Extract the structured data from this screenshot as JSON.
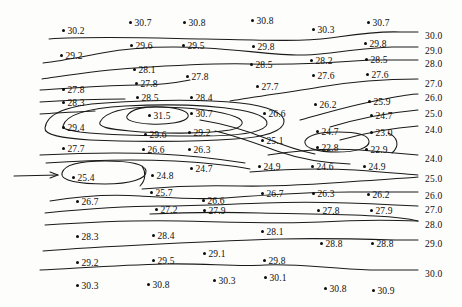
{
  "figure": {
    "type": "contour-map",
    "background_color": "#fdfdfc",
    "line_color": "#1a1a1a",
    "text_color": "#0d0d0d"
  },
  "annotations": {
    "flow_arrow": {
      "name": "left-flow-arrow",
      "x1": 14,
      "y1": 176,
      "x2": 62,
      "y2": 175
    }
  },
  "chart_data": {
    "type": "heatmap",
    "title": "",
    "xlabel": "",
    "ylabel": "",
    "contour_interval": 1.0,
    "contour_levels": [
      24.0,
      25.0,
      26.0,
      27.0,
      28.0,
      29.0,
      30.0
    ],
    "grid": false,
    "legend": "none",
    "right_axis_labels": [
      {
        "text": "30.0",
        "x": 425,
        "y": 32
      },
      {
        "text": "29.0",
        "x": 425,
        "y": 47
      },
      {
        "text": "28.0",
        "x": 425,
        "y": 60
      },
      {
        "text": "27.0",
        "x": 425,
        "y": 80
      },
      {
        "text": "26.0",
        "x": 425,
        "y": 94
      },
      {
        "text": "25.0",
        "x": 425,
        "y": 110
      },
      {
        "text": "24.0",
        "x": 425,
        "y": 126
      },
      {
        "text": "24.0",
        "x": 425,
        "y": 155
      },
      {
        "text": "25.0",
        "x": 425,
        "y": 175
      },
      {
        "text": "26.0",
        "x": 425,
        "y": 192
      },
      {
        "text": "27.0",
        "x": 425,
        "y": 206
      },
      {
        "text": "28.0",
        "x": 425,
        "y": 221
      },
      {
        "text": "29.0",
        "x": 425,
        "y": 240
      },
      {
        "text": "30.0",
        "x": 425,
        "y": 270
      }
    ],
    "points": [
      {
        "value": "30.2",
        "x": 62,
        "y": 27
      },
      {
        "value": "30.7",
        "x": 129,
        "y": 19
      },
      {
        "value": "30.8",
        "x": 183,
        "y": 19
      },
      {
        "value": "30.8",
        "x": 251,
        "y": 17
      },
      {
        "value": "30.3",
        "x": 312,
        "y": 26
      },
      {
        "value": "30.7",
        "x": 367,
        "y": 19
      },
      {
        "value": "29.2",
        "x": 60,
        "y": 52
      },
      {
        "value": "29.6",
        "x": 130,
        "y": 42
      },
      {
        "value": "29.5",
        "x": 182,
        "y": 42
      },
      {
        "value": "29.8",
        "x": 252,
        "y": 43
      },
      {
        "value": "29.8",
        "x": 364,
        "y": 40
      },
      {
        "value": "28.1",
        "x": 133,
        "y": 66
      },
      {
        "value": "28.5",
        "x": 250,
        "y": 61
      },
      {
        "value": "28.2",
        "x": 310,
        "y": 57
      },
      {
        "value": "28.5",
        "x": 365,
        "y": 56
      },
      {
        "value": "27.8",
        "x": 186,
        "y": 73
      },
      {
        "value": "27.8",
        "x": 62,
        "y": 86
      },
      {
        "value": "27.8",
        "x": 135,
        "y": 80
      },
      {
        "value": "27.7",
        "x": 256,
        "y": 83
      },
      {
        "value": "27.6",
        "x": 312,
        "y": 72
      },
      {
        "value": "27.6",
        "x": 366,
        "y": 71
      },
      {
        "value": "28.3",
        "x": 62,
        "y": 99
      },
      {
        "value": "28.5",
        "x": 136,
        "y": 94
      },
      {
        "value": "28.4",
        "x": 190,
        "y": 94
      },
      {
        "value": "31.5",
        "x": 148,
        "y": 112
      },
      {
        "value": "30.7",
        "x": 190,
        "y": 110
      },
      {
        "value": "26.6",
        "x": 263,
        "y": 110
      },
      {
        "value": "26.2",
        "x": 314,
        "y": 101
      },
      {
        "value": "25.9",
        "x": 368,
        "y": 98
      },
      {
        "value": "29.4",
        "x": 62,
        "y": 124
      },
      {
        "value": "29.6",
        "x": 144,
        "y": 131
      },
      {
        "value": "29.2",
        "x": 188,
        "y": 129
      },
      {
        "value": "24.7",
        "x": 370,
        "y": 112
      },
      {
        "value": "24.7",
        "x": 316,
        "y": 128
      },
      {
        "value": "23.0",
        "x": 370,
        "y": 129
      },
      {
        "value": "25.1",
        "x": 261,
        "y": 137
      },
      {
        "value": "22.8",
        "x": 316,
        "y": 144
      },
      {
        "value": "22.9",
        "x": 365,
        "y": 146
      },
      {
        "value": "27.7",
        "x": 62,
        "y": 145
      },
      {
        "value": "26.6",
        "x": 142,
        "y": 146
      },
      {
        "value": "26.3",
        "x": 188,
        "y": 146
      },
      {
        "value": "24.9",
        "x": 258,
        "y": 163
      },
      {
        "value": "24.6",
        "x": 311,
        "y": 163
      },
      {
        "value": "24.9",
        "x": 363,
        "y": 163
      },
      {
        "value": "25.4",
        "x": 72,
        "y": 174
      },
      {
        "value": "24.8",
        "x": 151,
        "y": 172
      },
      {
        "value": "24.7",
        "x": 190,
        "y": 165
      },
      {
        "value": "25.7",
        "x": 150,
        "y": 189
      },
      {
        "value": "26.6",
        "x": 202,
        "y": 197
      },
      {
        "value": "26.7",
        "x": 261,
        "y": 190
      },
      {
        "value": "26.3",
        "x": 312,
        "y": 190
      },
      {
        "value": "26.2",
        "x": 367,
        "y": 191
      },
      {
        "value": "26.7",
        "x": 76,
        "y": 198
      },
      {
        "value": "27.2",
        "x": 155,
        "y": 206
      },
      {
        "value": "27.9",
        "x": 203,
        "y": 207
      },
      {
        "value": "27.8",
        "x": 317,
        "y": 207
      },
      {
        "value": "27.9",
        "x": 370,
        "y": 207
      },
      {
        "value": "28.3",
        "x": 76,
        "y": 233
      },
      {
        "value": "28.4",
        "x": 152,
        "y": 232
      },
      {
        "value": "28.1",
        "x": 261,
        "y": 228
      },
      {
        "value": "28.8",
        "x": 320,
        "y": 240
      },
      {
        "value": "28.8",
        "x": 371,
        "y": 240
      },
      {
        "value": "29.2",
        "x": 76,
        "y": 259
      },
      {
        "value": "29.5",
        "x": 152,
        "y": 257
      },
      {
        "value": "29.1",
        "x": 203,
        "y": 250
      },
      {
        "value": "29.8",
        "x": 263,
        "y": 257
      },
      {
        "value": "30.3",
        "x": 76,
        "y": 282
      },
      {
        "value": "30.8",
        "x": 147,
        "y": 281
      },
      {
        "value": "30.3",
        "x": 213,
        "y": 277
      },
      {
        "value": "30.1",
        "x": 264,
        "y": 274
      },
      {
        "value": "30.8",
        "x": 324,
        "y": 285
      },
      {
        "value": "30.9",
        "x": 372,
        "y": 287
      }
    ]
  }
}
